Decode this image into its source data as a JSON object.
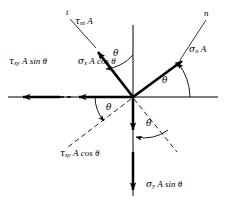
{
  "figure": {
    "kind": "free-body-diagram",
    "origin": {
      "x": 133,
      "y": 97
    },
    "background_color": "#ffffff",
    "stroke_color": "#000000"
  },
  "axes": {
    "t_axis": {
      "label": "t",
      "label_x": 67,
      "label_y": 12,
      "angle_deg_from_vertical": 38
    },
    "n_axis": {
      "label": "n",
      "label_x": 205,
      "label_y": 13,
      "angle_deg_from_horizontal": 37
    },
    "x_axis": {
      "label": "",
      "from_x": 8,
      "to_x": 218,
      "y": 97
    },
    "y_axis": {
      "label": "",
      "x": 133,
      "from_y": 25,
      "to_y": 196
    }
  },
  "force_vectors": [
    {
      "id": "tau-nt-A",
      "name": "shear-force-nt",
      "text_parts": {
        "symbol": "τ",
        "sub": "nt",
        "rest": "A"
      },
      "label_x": 76,
      "label_y": 20,
      "direction": "up-left along t axis"
    },
    {
      "id": "sigma-n-A",
      "name": "normal-force-n",
      "text_parts": {
        "symbol": "σ",
        "sub": "n",
        "rest": "A"
      },
      "label_x": 190,
      "label_y": 48,
      "direction": "up-right along n axis"
    },
    {
      "id": "tau-xy-A-sin-theta",
      "name": "shear-force-xy-sin",
      "text_parts": {
        "symbol": "τ",
        "sub": "xy",
        "rest": "A sin θ"
      },
      "label_x": 10,
      "label_y": 60,
      "direction": "left along negative x"
    },
    {
      "id": "sigma-x-A-cos-theta",
      "name": "normal-force-x-cos",
      "text_parts": {
        "symbol": "σ",
        "sub": "x",
        "rest": "A cos θ"
      },
      "label_x": 79,
      "label_y": 60,
      "direction": "left along negative x"
    },
    {
      "id": "tau-xy-A-cos-theta",
      "name": "shear-force-xy-cos",
      "text_parts": {
        "symbol": "τ",
        "sub": "xy",
        "rest": "A cos θ"
      },
      "label_x": 61,
      "label_y": 152,
      "direction": "down along negative y"
    },
    {
      "id": "sigma-y-A-sin-theta",
      "name": "normal-force-y-sin",
      "text_parts": {
        "symbol": "σ",
        "sub": "y",
        "rest": "A sin θ"
      },
      "label_x": 146,
      "label_y": 182,
      "direction": "down along negative y"
    }
  ],
  "angles": [
    {
      "id": "theta-top",
      "label": "θ",
      "x": 115,
      "y": 54,
      "between": "y-axis and t-axis"
    },
    {
      "id": "theta-right",
      "label": "θ",
      "x": 163,
      "y": 80,
      "between": "x-axis and n-axis"
    },
    {
      "id": "theta-left",
      "label": "θ",
      "x": 107,
      "y": 108,
      "between": "negative x-axis and n-axis extension"
    },
    {
      "id": "theta-bottom",
      "label": "θ",
      "x": 147,
      "y": 124,
      "between": "negative y-axis and t-axis extension"
    }
  ],
  "colors": {
    "stroke": "#000000",
    "background": "#ffffff",
    "thin_line": "#1a1a1a"
  }
}
